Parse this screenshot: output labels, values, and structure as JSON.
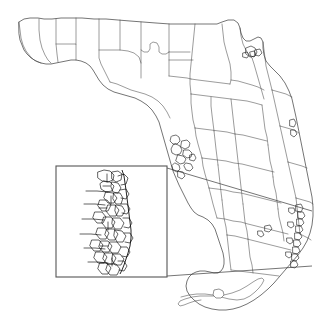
{
  "figure": {
    "background_color": "#ffffff",
    "outline_color": "#3a3a3a",
    "county_line_color": "#4a4a4a",
    "place_line_color": "#151515",
    "inset_frame_color": "#555555",
    "leader_line_color": "#3a3a3a",
    "width": 325,
    "height": 330
  },
  "inset": {
    "label": "Inset detail",
    "description": "Magnified southeast coastal corridor showing dense municipal boundaries",
    "frame": {
      "x": 56,
      "y": 166,
      "width": 111,
      "height": 111
    },
    "leader_lines": [
      {
        "from_x": 167,
        "from_y": 168,
        "to_x": 312,
        "to_y": 211
      },
      {
        "from_x": 167,
        "from_y": 276,
        "to_x": 312,
        "to_y": 266
      }
    ],
    "source_region": {
      "x": 296,
      "y": 205,
      "width": 18,
      "height": 68
    }
  },
  "map": {
    "state_outline": "M 19 22 L 24 19 L 30 18 L 38 18 L 44 19 L 52 19 L 61 18 L 70 18 L 82 18 L 94 19 L 106 19 L 118 20 L 130 21 L 143 22 L 156 23 L 170 24 L 182 24 L 195 24 L 208 24 L 217 24 L 222 22 L 228 20 L 234 20 L 238 23 L 240 28 L 241 33 L 243 38 L 246 41 L 250 41 L 254 39 L 258 37 L 261 38 L 263 42 L 263 48 L 264 55 L 266 61 L 270 66 L 275 71 L 280 76 L 285 83 L 289 91 L 292 99 L 294 108 L 296 117 L 298 127 L 300 137 L 302 147 L 304 157 L 306 167 L 308 177 L 310 187 L 312 197 L 313 207 L 313 216 L 312 225 L 310 233 L 307 241 L 303 248 L 298 255 L 292 262 L 286 269 L 280 276 L 274 283 L 268 289 L 261 295 L 254 300 L 247 304 L 240 307 L 233 309 L 226 310 L 219 310 L 212 309 L 205 307 L 199 304 L 194 300 L 190 296 L 187 291 L 186 286 L 187 281 L 189 277 L 192 274 L 196 272 L 200 271 L 205 271 L 210 272 L 214 273 L 218 273 L 221 271 L 223 268 L 224 264 L 224 259 L 223 253 L 221 247 L 219 241 L 217 235 L 215 229 L 212 224 L 208 220 L 203 217 L 198 215 L 194 212 L 191 208 L 188 203 L 185 197 L 182 191 L 179 185 L 176 178 L 173 171 L 171 164 L 169 157 L 167 150 L 165 143 L 163 136 L 161 129 L 159 122 L 156 116 L 152 110 L 147 105 L 141 101 L 135 98 L 128 96 L 121 94 L 114 92 L 108 89 L 103 85 L 99 80 L 96 75 L 93 70 L 90 66 L 86 63 L 81 61 L 76 60 L 71 60 L 66 61 L 61 62 L 56 63 L 51 64 L 46 64 L 41 63 L 36 61 L 31 58 L 27 54 L 24 50 L 22 45 L 20 40 L 19 34 Z",
    "county_lines": [
      "M 19 22 L 20 30 L 21 38 L 23 45 L 26 51 L 30 56 L 34 60 L 38 62 L 41 63",
      "M 39 19 L 39 30 L 40 40 L 42 48 L 45 55 L 48 60 L 51 63",
      "M 56 19 L 56 32 L 56 44 L 57 54 L 58 62",
      "M 56 44 L 63 44 L 70 44 L 76 44 L 76 52 L 76 60",
      "M 76 18 L 76 28 L 76 38 L 76 44",
      "M 99 19 L 99 30 L 99 40 L 99 50 L 99 58 L 101 64 L 104 70 L 107 76 L 110 82",
      "M 99 50 L 106 50 L 113 50 L 120 50 L 128 51 L 134 53 L 139 57 L 141 63 L 141 70 L 141 78",
      "M 120 20 L 120 30 L 120 40 L 120 50",
      "M 141 22 L 141 33 L 141 44 L 141 50 L 144 52 L 148 52 L 150 49 L 150 44 L 153 42 L 157 43 L 159 47 L 159 52 L 162 54 L 166 54 L 169 52",
      "M 169 24 L 169 35 L 169 45 L 169 52 L 169 60 L 169 68 L 169 76",
      "M 141 50 L 141 58 L 141 63",
      "M 195 24 L 194 34 L 193 44 L 192 54 L 191 64 L 190 74 L 190 84 L 191 94",
      "M 169 60 L 178 60 L 187 60 L 193 60",
      "M 169 76 L 178 77 L 187 78 L 191 79",
      "M 191 79 L 198 80 L 206 81 L 214 82 L 222 83 L 230 84",
      "M 222 24 L 223 33 L 224 42 L 226 50 L 228 57 L 230 64 L 231 72 L 231 80 L 230 84",
      "M 240 28 L 241 36 L 243 44 L 246 50 L 249 55 L 252 58",
      "M 252 58 L 254 64 L 256 71 L 258 78 L 260 85 L 262 92 L 264 99",
      "M 231 80 L 238 81 L 245 83 L 252 85 L 258 87 L 264 90",
      "M 191 94 L 199 95 L 207 96 L 215 97 L 223 98 L 231 99 L 239 100 L 247 101 L 255 103 L 262 105",
      "M 191 94 L 191 103 L 192 112 L 193 120 L 195 128",
      "M 211 97 L 211 106 L 212 115 L 213 123 L 214 131",
      "M 231 99 L 232 108 L 233 117 L 234 126 L 235 134",
      "M 195 128 L 203 129 L 211 130 L 219 131 L 227 132 L 235 134 L 243 135 L 251 137 L 259 139 L 267 141",
      "M 262 105 L 263 113 L 264 121 L 265 129 L 267 137 L 268 145",
      "M 195 128 L 196 136 L 198 144 L 200 151 L 202 158",
      "M 214 131 L 215 140 L 216 149 L 217 157 L 218 165",
      "M 235 134 L 236 143 L 237 152 L 238 161 L 239 169",
      "M 202 158 L 210 159 L 218 160 L 226 161 L 234 163 L 242 164 L 250 166 L 258 168 L 266 170 L 274 172",
      "M 268 145 L 269 153 L 270 161 L 272 169 L 273 177",
      "M 202 158 L 203 166 L 205 174 L 207 181 L 209 188",
      "M 218 165 L 219 174 L 220 183 L 221 192 L 222 200",
      "M 239 169 L 240 178 L 241 187 L 242 196 L 243 204",
      "M 209 188 L 217 189 L 225 190 L 233 192 L 241 193 L 249 195 L 257 197 L 265 199 L 273 201 L 281 203",
      "M 273 177 L 274 185 L 276 193 L 277 201 L 278 209",
      "M 209 188 L 211 196 L 213 204 L 215 211 L 217 218",
      "M 222 200 L 223 209 L 224 218 L 226 227 L 227 235",
      "M 243 204 L 244 213 L 245 222 L 247 231 L 248 239",
      "M 217 218 L 225 219 L 233 221 L 241 222 L 248 224 L 256 226 L 264 228 L 272 230 L 280 232 L 288 234",
      "M 278 209 L 279 217 L 281 225 L 283 233 L 284 241",
      "M 227 235 L 235 236 L 243 238 L 251 240 L 259 242 L 267 244 L 275 246 L 283 248 L 291 250",
      "M 248 239 L 249 248 L 250 257 L 252 265 L 253 273",
      "M 227 235 L 228 244 L 229 253 L 230 262 L 231 270",
      "M 231 270 L 239 271 L 247 272 L 255 273 L 263 274 L 271 275 L 279 276",
      "M 263 42 L 264 50 L 265 58 L 266 66 L 268 74 L 270 82 L 272 90",
      "M 272 90 L 279 92 L 286 94 L 292 97",
      "M 272 90 L 274 99 L 276 108 L 278 117 L 280 126",
      "M 280 126 L 287 128 L 294 130 L 299 133",
      "M 280 126 L 282 135 L 284 144 L 286 153 L 288 162",
      "M 288 162 L 295 164 L 302 166 L 307 168",
      "M 288 162 L 290 171 L 292 180 L 294 189 L 296 198",
      "M 296 198 L 303 200 L 310 202 L 313 204",
      "M 296 198 L 297 207 L 298 216 L 299 225 L 300 234",
      "M 300 234 L 304 236 L 308 238 L 311 240",
      "M 110 82 L 117 84 L 124 87 L 131 90 L 138 92 L 145 94 L 152 97 L 158 101 L 163 106 L 167 112 L 170 118",
      "M 169 52 L 176 52 L 183 52 L 190 52"
    ],
    "place_lines": [
      "M 172 136 L 176 135 L 179 137 L 180 141 L 177 144 L 173 144 L 170 141 L 171 137 Z",
      "M 176 144 L 180 146 L 182 150 L 180 154 L 176 155 L 172 153 L 171 149 L 173 145 Z",
      "M 182 141 L 187 140 L 190 143 L 189 147 L 185 149 L 181 147 Z",
      "M 178 155 L 183 156 L 186 159 L 184 163 L 180 164 L 176 161 Z",
      "M 184 150 L 189 150 L 192 153 L 191 157 L 187 158 L 183 155 Z",
      "M 186 163 L 191 164 L 193 168 L 190 171 L 186 170 L 184 166 Z",
      "M 175 163 L 179 165 L 180 169 L 177 172 L 173 170 L 172 166 Z",
      "M 190 155 L 194 154 L 196 158 L 194 161 L 190 160 Z",
      "M 178 171 L 183 172 L 185 176 L 182 179 L 178 177 Z",
      "M 246 48 L 251 46 L 255 48 L 257 52 L 255 56 L 250 57 L 246 54 Z",
      "M 250 52 L 254 51 L 256 54 L 254 57 L 251 56 Z",
      "M 243 53 L 247 52 L 249 55 L 247 58 L 243 57 Z",
      "M 255 50 L 260 49 L 262 53 L 259 56 L 255 55 Z",
      "M 290 120 L 294 119 L 296 123 L 294 127 L 290 126 Z",
      "M 291 130 L 295 130 L 297 134 L 294 137 L 291 135 Z",
      "M 296 205 L 301 204 L 303 208 L 301 212 L 296 211 Z",
      "M 298 212 L 303 212 L 305 216 L 302 219 L 298 218 Z",
      "M 297 219 L 302 219 L 304 223 L 301 226 L 297 225 Z",
      "M 296 226 L 301 226 L 303 230 L 300 233 L 296 232 Z",
      "M 295 233 L 300 233 L 302 237 L 299 240 L 295 239 Z",
      "M 294 240 L 299 240 L 301 244 L 298 247 L 294 246 Z",
      "M 293 247 L 298 247 L 300 251 L 297 254 L 293 253 Z",
      "M 292 254 L 297 254 L 299 258 L 296 261 L 292 260 Z",
      "M 291 261 L 296 261 L 298 265 L 295 268 L 291 267 Z",
      "M 289 208 L 294 208 L 295 212 L 292 214 L 289 212 Z",
      "M 288 222 L 293 222 L 294 226 L 291 228 L 288 226 Z",
      "M 287 238 L 292 238 L 293 242 L 290 244 L 287 242 Z",
      "M 286 252 L 291 252 L 292 256 L 289 258 L 286 256 Z",
      "M 265 226 L 270 225 L 272 229 L 269 232 L 265 231 Z",
      "M 258 231 L 262 231 L 264 235 L 261 237 L 258 235 Z"
    ],
    "islands": [
      "M 214 290 L 219 289 L 223 291 L 224 295 L 221 298 L 216 298 L 213 295 Z"
    ],
    "keys_chain": "M 181 297 L 189 295 L 197 294 L 205 294 L 213 295 L 221 297 L 229 299 L 237 300 L 244 299 L 250 296 L 255 292 L 259 288 L 262 284 L 264 280 L 262 278 L 258 279 L 253 282 L 247 286 L 240 290 L 232 293 L 224 295 L 216 296 L 208 296 L 200 296 L 192 297 L 185 299 L 180 301 L 178 304 L 180 306 L 184 305 L 189 303 L 195 301 L 201 300"
  },
  "inset_content": {
    "coastline": "M 122 170 L 124 176 L 125 183 L 126 190 L 127 198 L 128 206 L 129 214 L 130 222 L 131 230 L 131 238 L 130 246 L 128 253 L 126 259 L 124 265 L 122 270 L 120 274",
    "detail_paths": [
      "M 98 172 L 104 170 L 110 171 L 114 175 L 113 180 L 108 182 L 102 181 L 98 178 Z",
      "M 104 181 L 110 182 L 114 186 L 112 191 L 106 192 L 101 189 L 100 184 Z",
      "M 112 172 L 118 171 L 122 174 L 121 180 L 116 182 L 112 179 Z",
      "M 112 182 L 118 183 L 121 188 L 118 193 L 113 192 L 111 187 Z",
      "M 106 192 L 113 193 L 117 198 L 114 203 L 108 203 L 104 198 Z",
      "M 114 193 L 120 193 L 123 198 L 121 204 L 116 204 L 113 199 Z",
      "M 100 200 L 107 200 L 111 205 L 108 211 L 102 211 L 98 206 Z",
      "M 108 205 L 115 205 L 119 210 L 116 216 L 110 216 L 106 211 Z",
      "M 116 205 L 122 206 L 125 211 L 122 216 L 117 216 L 115 211 Z",
      "M 95 212 L 102 212 L 106 217 L 103 223 L 97 223 L 93 218 Z",
      "M 104 217 L 111 217 L 115 222 L 112 228 L 106 228 L 102 223 Z",
      "M 113 218 L 120 218 L 124 223 L 121 229 L 115 229 L 112 224 Z",
      "M 98 228 L 105 228 L 109 233 L 106 239 L 100 239 L 96 234 Z",
      "M 107 229 L 114 229 L 118 234 L 115 240 L 109 240 L 105 235 Z",
      "M 115 230 L 122 231 L 126 236 L 123 242 L 117 242 L 114 236 Z",
      "M 92 240 L 99 240 L 103 245 L 100 251 L 94 251 L 90 246 Z",
      "M 101 241 L 108 241 L 112 246 L 109 252 L 103 252 L 99 247 Z",
      "M 110 242 L 117 242 L 121 247 L 118 253 L 112 253 L 108 248 Z",
      "M 96 252 L 103 252 L 107 257 L 104 263 L 98 263 L 94 258 Z",
      "M 105 253 L 112 253 L 116 258 L 113 264 L 107 264 L 103 259 Z",
      "M 113 254 L 120 254 L 124 259 L 121 265 L 115 265 L 112 260 Z",
      "M 100 263 L 107 263 L 111 268 L 108 274 L 102 274 L 98 269 Z",
      "M 108 264 L 116 264 L 120 269 L 117 275 L 110 275 L 106 270 Z",
      "M 86 191 L 97 191 L 108 192",
      "M 84 204 L 95 204 L 105 205",
      "M 82 219 L 93 219 L 104 220",
      "M 80 234 L 91 234 L 101 235",
      "M 84 248 L 95 248 L 105 249",
      "M 88 262 L 98 262 L 108 263",
      "M 118 176 L 124 174 L 128 178 L 126 184 L 121 185",
      "M 120 190 L 126 189 L 129 194 L 126 199 L 121 198",
      "M 121 204 L 127 204 L 130 209 L 127 214 L 122 213",
      "M 123 218 L 129 218 L 132 223 L 129 228 L 124 227",
      "M 124 233 L 130 233 L 133 238 L 130 243 L 125 242",
      "M 121 247 L 127 247 L 130 252 L 127 257 L 122 256",
      "M 118 261 L 124 261 L 127 266 L 124 271 L 119 270",
      "M 107 174 L 107 182",
      "M 103 186 L 110 186",
      "M 111 196 L 111 204",
      "M 99 208 L 107 208",
      "M 108 222 L 108 230",
      "M 100 246 L 108 246",
      "M 112 258 L 112 266"
    ]
  }
}
